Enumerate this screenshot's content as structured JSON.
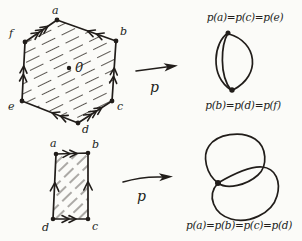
{
  "canvas": {
    "background": "#fbfbf8",
    "ink_color": "#211d1a",
    "hatch_color": "#4a453f"
  },
  "hexagon_figure": {
    "vertices": {
      "a": "a",
      "b": "b",
      "c": "c",
      "d": "d",
      "e": "e",
      "f": "f"
    },
    "center_point_label": "0"
  },
  "top_map": {
    "label": "p"
  },
  "theta_graph": {
    "top_vertex_label": "p(a)=p(c)=p(e)",
    "bottom_vertex_label": "p(b)=p(d)=p(f)"
  },
  "square_figure": {
    "vertices": {
      "a": "a",
      "b": "b",
      "c": "c",
      "d": "d"
    }
  },
  "bottom_map": {
    "label": "p"
  },
  "figure_eight": {
    "vertex_label": "p(a)=p(b)=p(c)=p(d)"
  }
}
